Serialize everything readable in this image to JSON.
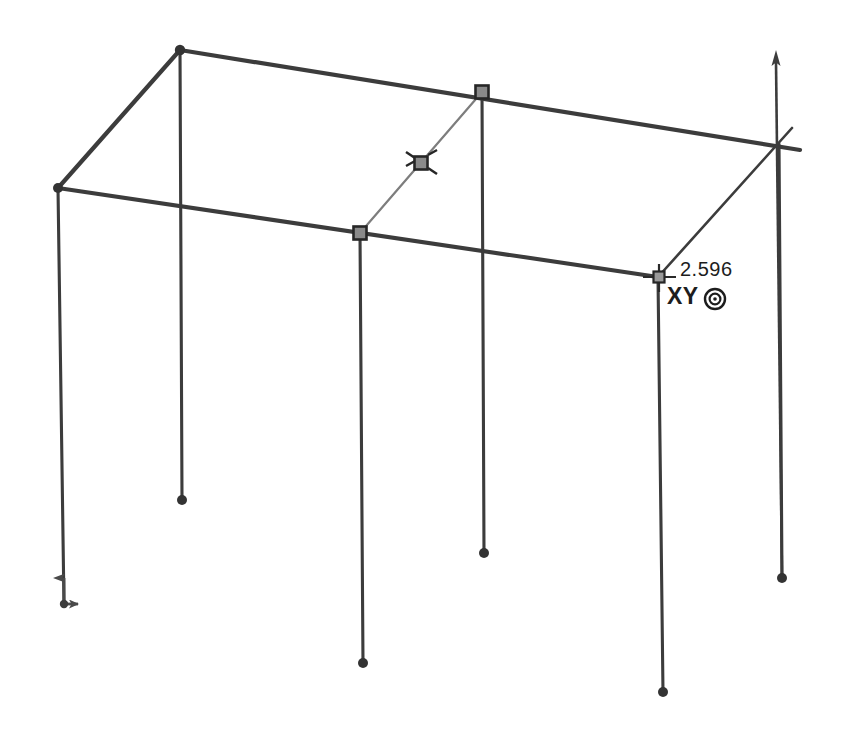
{
  "view": {
    "background_color": "#ffffff",
    "line_color": "#3c3c3c",
    "brace_color": "#6b6b6b",
    "node_fill_color": "#7a7a7a",
    "text_color": "#1d1d1d",
    "width": 861,
    "height": 732
  },
  "annotations": {
    "dimension_value": "2.596",
    "work_plane_label": "XY",
    "work_plane_icon": "target-circle-icon"
  },
  "axis_triad": {
    "origin": {
      "x": 64,
      "y": 604
    },
    "vertical_axis": {
      "x2": 64,
      "y2": 566,
      "arrow": "up"
    },
    "horizontal_axis": {
      "x2": 86,
      "y2": 604,
      "arrow": "right"
    }
  },
  "geometry": {
    "nodes": [
      {
        "id": "back-left-top",
        "x": 180,
        "y": 50,
        "marker": "dot"
      },
      {
        "id": "front-left-top",
        "x": 58,
        "y": 188,
        "marker": "dot"
      },
      {
        "id": "back-mid-top",
        "x": 482,
        "y": 92,
        "marker": "square"
      },
      {
        "id": "front-mid-top",
        "x": 360,
        "y": 233,
        "marker": "square"
      },
      {
        "id": "brace-release-mid",
        "x": 421,
        "y": 163,
        "marker": "square-release"
      },
      {
        "id": "front-right-top",
        "x": 658,
        "y": 277,
        "marker": "crosshair"
      },
      {
        "id": "back-right-top",
        "x": 779,
        "y": 144,
        "marker": "none"
      },
      {
        "id": "base-col-a",
        "x": 182,
        "y": 500,
        "marker": "dot"
      },
      {
        "id": "base-col-b",
        "x": 363,
        "y": 663,
        "marker": "dot"
      },
      {
        "id": "base-col-c",
        "x": 484,
        "y": 553,
        "marker": "dot"
      },
      {
        "id": "base-col-d",
        "x": 663,
        "y": 692,
        "marker": "dot"
      },
      {
        "id": "base-col-e",
        "x": 782,
        "y": 578,
        "marker": "dot"
      }
    ],
    "beams": [
      {
        "id": "beam-back-top",
        "x1": 180,
        "y1": 50,
        "x2": 800,
        "y2": 150,
        "weight": "heavy"
      },
      {
        "id": "beam-front-top",
        "x1": 58,
        "y1": 188,
        "x2": 658,
        "y2": 277,
        "weight": "heavy"
      },
      {
        "id": "beam-left-top",
        "x1": 58,
        "y1": 188,
        "x2": 180,
        "y2": 50,
        "weight": "heavy"
      }
    ],
    "columns": [
      {
        "id": "column-front-left",
        "x1": 58,
        "y1": 188,
        "x2": 64,
        "y2": 606,
        "weight": "medium"
      },
      {
        "id": "column-back-left",
        "x1": 180,
        "y1": 50,
        "x2": 182,
        "y2": 500,
        "weight": "medium"
      },
      {
        "id": "column-front-mid",
        "x1": 360,
        "y1": 233,
        "x2": 363,
        "y2": 663,
        "weight": "medium"
      },
      {
        "id": "column-back-mid",
        "x1": 482,
        "y1": 92,
        "x2": 484,
        "y2": 553,
        "weight": "medium"
      },
      {
        "id": "column-front-right",
        "x1": 658,
        "y1": 277,
        "x2": 663,
        "y2": 692,
        "weight": "medium"
      },
      {
        "id": "column-back-right",
        "x1": 779,
        "y1": 144,
        "x2": 782,
        "y2": 578,
        "weight": "medium"
      }
    ],
    "braces": [
      {
        "id": "brace-mid-bay",
        "x1": 360,
        "y1": 233,
        "x2": 482,
        "y2": 92,
        "weight": "light"
      },
      {
        "id": "brace-right-bay",
        "x1": 658,
        "y1": 277,
        "x2": 790,
        "y2": 130,
        "weight": "medium"
      }
    ],
    "cursor_arrow": {
      "id": "vertical-cursor-arrow",
      "x1": 776,
      "y1": 55,
      "x2": 782,
      "y2": 578
    }
  }
}
